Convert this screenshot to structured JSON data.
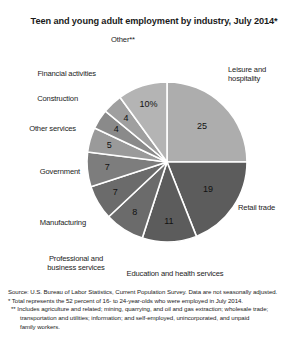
{
  "chart_data": {
    "type": "pie",
    "title": "Teen and young adult employment by industry, July 2014*",
    "xlabel": "",
    "ylabel": "",
    "legend_position": "callout-labels",
    "grid": false,
    "categories": [
      "Leisure and hospitality",
      "Retail trade",
      "Education and health services",
      "Professional and business services",
      "Manufacturing",
      "Government",
      "Other services",
      "Construction",
      "Financial activities",
      "Other**"
    ],
    "values": [
      25,
      19,
      11,
      8,
      7,
      7,
      5,
      4,
      4,
      10
    ],
    "value_labels": [
      "25",
      "19",
      "11",
      "8",
      "7",
      "7",
      "5",
      "4",
      "4",
      "10%"
    ],
    "units": "percent",
    "slices": [
      {
        "label": "Leisure and hospitality",
        "value": 25,
        "display": "25",
        "color": "#adadad"
      },
      {
        "label": "Retail trade",
        "value": 19,
        "display": "19",
        "color": "#5c5c5c"
      },
      {
        "label": "Education and health services",
        "value": 11,
        "display": "11",
        "color": "#5c5c5c"
      },
      {
        "label": "Professional and business services",
        "value": 8,
        "display": "8",
        "color": "#6b6b6b"
      },
      {
        "label": "Manufacturing",
        "value": 7,
        "display": "7",
        "color": "#6b6b6b"
      },
      {
        "label": "Government",
        "value": 7,
        "display": "7",
        "color": "#7d7d7d"
      },
      {
        "label": "Other services",
        "value": 5,
        "display": "5",
        "color": "#9a9a9a"
      },
      {
        "label": "Construction",
        "value": 4,
        "display": "4",
        "color": "#8a8a8a"
      },
      {
        "label": "Financial activities",
        "value": 4,
        "display": "4",
        "color": "#9f9f9f"
      },
      {
        "label": "Other**",
        "value": 10,
        "display": "10%",
        "color": "#b4b4b4"
      }
    ]
  },
  "labels": {
    "other": "Other**",
    "leisure": "Leisure and\nhospitality",
    "retail": "Retail trade",
    "education": "Education and health services",
    "professional": "Professional and\nbusiness services",
    "manufacturing": "Manufacturing",
    "government": "Government",
    "other_services": "Other services",
    "construction": "Construction",
    "financial": "Financial activities"
  },
  "values": {
    "other": "10%",
    "leisure": "25",
    "retail": "19",
    "education": "11",
    "professional": "8",
    "manufacturing": "7",
    "government": "7",
    "other_services": "5",
    "construction": "4",
    "financial": "4"
  },
  "footnotes": {
    "source": "Source: U.S. Bureau of Labor Statistics, Current Population Survey. Data are not seasonally adjusted.",
    "star": "* Total represents the 52 percent of 16- to 24-year-olds who were employed in July 2014.",
    "doublestar_line1": "** Includes agriculture and related; mining, quarrying, and oil and gas extraction; wholesale trade;",
    "doublestar_line2": "transportation and utilities; information; and self-employed, unincorporated, and unpaid",
    "doublestar_line3": "family workers."
  }
}
